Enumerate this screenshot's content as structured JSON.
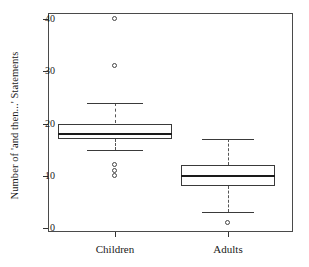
{
  "chart_data": {
    "type": "box",
    "title": "",
    "xlabel": "",
    "ylabel": "Number of 'and then...' Statements",
    "ylim": [
      0,
      42
    ],
    "yticks": [
      0,
      10,
      20,
      30,
      40
    ],
    "ytick_labels": [
      "0",
      "10",
      "20",
      "30",
      "40"
    ],
    "grid": false,
    "legend": "none",
    "categories": [
      "Children",
      "Adults"
    ],
    "boxes": [
      {
        "name": "Children",
        "whisker_low": 15,
        "q1": 17,
        "median": 18,
        "q3": 20,
        "whisker_high": 24,
        "outliers": [
          10,
          11,
          12,
          31,
          40
        ]
      },
      {
        "name": "Adults",
        "whisker_low": 3,
        "q1": 8,
        "median": 10,
        "q3": 12,
        "whisker_high": 17,
        "outliers": [
          1
        ]
      }
    ]
  },
  "axes": {
    "y_title": "Number of 'and then...' Statements",
    "y_labels": [
      "40",
      "30",
      "20",
      "10",
      "0"
    ],
    "x_labels": [
      "Children",
      "Adults"
    ]
  },
  "colors": {
    "background": "#ffffff",
    "frame": "#4a4a4a",
    "box_outline": "#3a3a3a",
    "median": "#1a1a1a",
    "whisker": "#555555",
    "outlier": "#444444",
    "text": "#1a1a1a"
  }
}
